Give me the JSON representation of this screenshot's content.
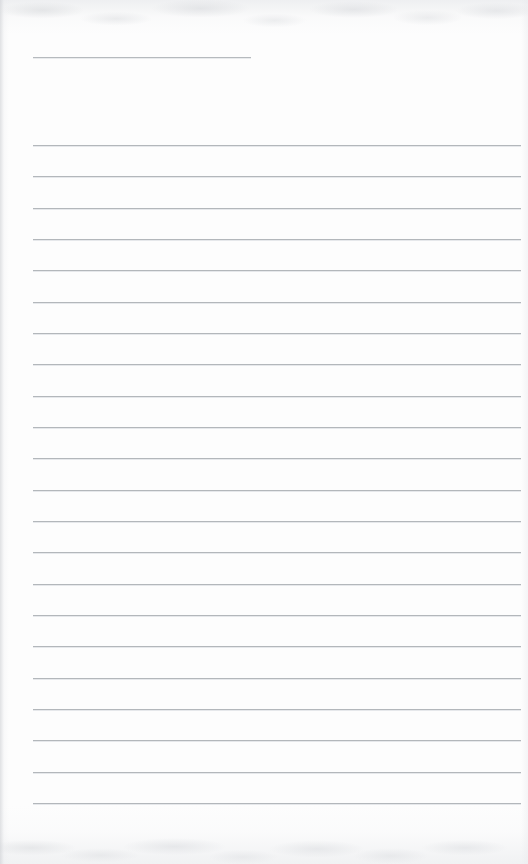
{
  "document": {
    "kind": "scanned-ruled-notebook-page",
    "title_text": "",
    "body_text": "",
    "page_width": 528,
    "page_height": 864
  },
  "colors": {
    "paper_background": "#fdfdfd",
    "rule_line": "#b3b7bb",
    "rule_line_highlight": "#e2e4e7",
    "header_rule_line": "#b6babe",
    "edge_shadow": "#ced0d4"
  },
  "header_rule": {
    "name": "header-rule",
    "x": 33,
    "y": 57,
    "width": 218,
    "label": ""
  },
  "ruled_lines": {
    "count": 22,
    "first_y": 145,
    "spacing": 31.3,
    "x_start": 33,
    "x_end": 521,
    "width": 488,
    "items": [
      {
        "index": 1,
        "y": 145,
        "text": ""
      },
      {
        "index": 2,
        "y": 176,
        "text": ""
      },
      {
        "index": 3,
        "y": 208,
        "text": ""
      },
      {
        "index": 4,
        "y": 239,
        "text": ""
      },
      {
        "index": 5,
        "y": 270,
        "text": ""
      },
      {
        "index": 6,
        "y": 302,
        "text": ""
      },
      {
        "index": 7,
        "y": 333,
        "text": ""
      },
      {
        "index": 8,
        "y": 364,
        "text": ""
      },
      {
        "index": 9,
        "y": 396,
        "text": ""
      },
      {
        "index": 10,
        "y": 427,
        "text": ""
      },
      {
        "index": 11,
        "y": 458,
        "text": ""
      },
      {
        "index": 12,
        "y": 490,
        "text": ""
      },
      {
        "index": 13,
        "y": 521,
        "text": ""
      },
      {
        "index": 14,
        "y": 552,
        "text": ""
      },
      {
        "index": 15,
        "y": 584,
        "text": ""
      },
      {
        "index": 16,
        "y": 615,
        "text": ""
      },
      {
        "index": 17,
        "y": 646,
        "text": ""
      },
      {
        "index": 18,
        "y": 678,
        "text": ""
      },
      {
        "index": 19,
        "y": 709,
        "text": ""
      },
      {
        "index": 20,
        "y": 740,
        "text": ""
      },
      {
        "index": 21,
        "y": 772,
        "text": ""
      },
      {
        "index": 22,
        "y": 803,
        "text": ""
      }
    ]
  }
}
